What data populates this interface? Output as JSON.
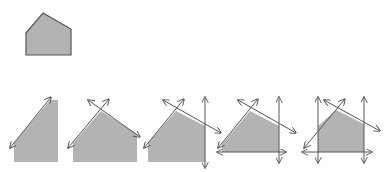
{
  "diagram": {
    "colors": {
      "fill": "#b3b3b3",
      "stroke": "#555555",
      "background": "#ffffff"
    },
    "original": {
      "label": "original-polygon",
      "points": [
        [
          26,
          33
        ],
        [
          43,
          13
        ],
        [
          71,
          29
        ],
        [
          71,
          55
        ],
        [
          26,
          55
        ]
      ]
    },
    "steps": [
      {
        "label": "step-1-clip-left-diagonal",
        "polygon": [
          [
            14,
            143
          ],
          [
            50,
            100
          ],
          [
            58,
            100
          ],
          [
            58,
            162
          ],
          [
            14,
            162
          ]
        ],
        "lines": [
          {
            "x1": 10,
            "y1": 148,
            "x2": 51,
            "y2": 97,
            "arrows": "both"
          }
        ]
      },
      {
        "label": "step-2-clip-top-edges",
        "polygon": [
          [
            73,
            143
          ],
          [
            101,
            111
          ],
          [
            137,
            134
          ],
          [
            137,
            162
          ],
          [
            73,
            162
          ]
        ],
        "lines": [
          {
            "x1": 68,
            "y1": 148,
            "x2": 109,
            "y2": 99,
            "arrows": "both"
          },
          {
            "x1": 88,
            "y1": 100,
            "x2": 140,
            "y2": 137,
            "arrows": "both"
          }
        ]
      },
      {
        "label": "step-3-clip-right",
        "polygon": [
          [
            148,
            143
          ],
          [
            176,
            111
          ],
          [
            205,
            126
          ],
          [
            205,
            162
          ],
          [
            148,
            162
          ]
        ],
        "lines": [
          {
            "x1": 144,
            "y1": 148,
            "x2": 184,
            "y2": 99,
            "arrows": "both"
          },
          {
            "x1": 163,
            "y1": 100,
            "x2": 221,
            "y2": 133,
            "arrows": "both"
          },
          {
            "x1": 205,
            "y1": 97,
            "x2": 205,
            "y2": 168,
            "arrows": "both"
          }
        ]
      },
      {
        "label": "step-4-clip-bottom",
        "polygon": [
          [
            222,
            144
          ],
          [
            250,
            111
          ],
          [
            279,
            126
          ],
          [
            279,
            152
          ],
          [
            222,
            152
          ]
        ],
        "lines": [
          {
            "x1": 218,
            "y1": 148,
            "x2": 258,
            "y2": 99,
            "arrows": "both"
          },
          {
            "x1": 238,
            "y1": 100,
            "x2": 296,
            "y2": 133,
            "arrows": "both"
          },
          {
            "x1": 279,
            "y1": 97,
            "x2": 279,
            "y2": 163,
            "arrows": "both"
          },
          {
            "x1": 217,
            "y1": 152,
            "x2": 286,
            "y2": 152,
            "arrows": "both"
          }
        ]
      },
      {
        "label": "step-5-clip-left-final",
        "polygon": [
          [
            318,
            126
          ],
          [
            336,
            110
          ],
          [
            364,
            124
          ],
          [
            364,
            152
          ],
          [
            318,
            152
          ]
        ],
        "lines": [
          {
            "x1": 304,
            "y1": 148,
            "x2": 345,
            "y2": 99,
            "arrows": "both"
          },
          {
            "x1": 324,
            "y1": 100,
            "x2": 380,
            "y2": 131,
            "arrows": "both"
          },
          {
            "x1": 318,
            "y1": 97,
            "x2": 318,
            "y2": 163,
            "arrows": "both"
          },
          {
            "x1": 364,
            "y1": 97,
            "x2": 364,
            "y2": 163,
            "arrows": "both"
          },
          {
            "x1": 302,
            "y1": 152,
            "x2": 372,
            "y2": 152,
            "arrows": "both"
          }
        ]
      }
    ]
  }
}
